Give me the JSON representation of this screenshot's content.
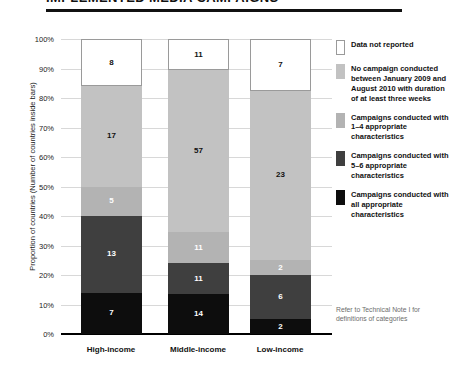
{
  "title": "IMPLEMENTED MEDIA CAMPAIGNS",
  "axis": {
    "y_title": "Proportion of countries (Number of countries inside bars)",
    "y_ticks": [
      "100%",
      "90%",
      "80%",
      "70%",
      "60%",
      "50%",
      "40%",
      "30%",
      "20%",
      "10%",
      "0%"
    ]
  },
  "legend": {
    "items": [
      {
        "label": "Data not reported",
        "color": "#ffffff",
        "border": "#9a9a9a"
      },
      {
        "label": "No campaign conducted between January 2009 and August 2010 with duration of at least three weeks",
        "color": "#c2c2c2",
        "border": "#c2c2c2"
      },
      {
        "label": "Campaigns conducted with 1–4 appropriate characteristics",
        "color": "#b3b3b3",
        "border": "#b3b3b3"
      },
      {
        "label": "Campaigns conducted with 5–6 appropriate characteristics",
        "color": "#3f3f3f",
        "border": "#3f3f3f"
      },
      {
        "label": "Campaigns conducted with all appropriate characteristics",
        "color": "#0d0d0d",
        "border": "#0d0d0d"
      }
    ]
  },
  "technical_note": "Refer to Technical Note I for definitions of categories",
  "chart_data": {
    "type": "bar",
    "subtype": "stacked-100-percent",
    "title": "IMPLEMENTED MEDIA CAMPAIGNS",
    "xlabel": "",
    "ylabel": "Proportion of countries (Number of countries inside bars)",
    "ylim": [
      0,
      100
    ],
    "ytick_step": 10,
    "grid": true,
    "legend_position": "right",
    "categories": [
      "High-income",
      "Middle-income",
      "Low-income"
    ],
    "category_totals": [
      50,
      104,
      40
    ],
    "stack_order_bottom_to_top": [
      "Campaigns conducted with all appropriate characteristics",
      "Campaigns conducted with 5–6 appropriate characteristics",
      "Campaigns conducted with 1–4 appropriate characteristics",
      "No campaign conducted between January 2009 and August 2010 with duration of at least three weeks",
      "Data not reported"
    ],
    "series": [
      {
        "name": "Campaigns conducted with all appropriate characteristics",
        "color": "#0d0d0d",
        "label_color": "#ffffff",
        "values": [
          7,
          14,
          2
        ],
        "percents": [
          14.0,
          13.5,
          5.0
        ]
      },
      {
        "name": "Campaigns conducted with 5–6 appropriate characteristics",
        "color": "#3f3f3f",
        "label_color": "#ffffff",
        "values": [
          13,
          11,
          6
        ],
        "percents": [
          26.0,
          10.6,
          15.0
        ]
      },
      {
        "name": "Campaigns conducted with 1–4 appropriate characteristics",
        "color": "#b3b3b3",
        "label_color": "#ffffff",
        "values": [
          5,
          11,
          2
        ],
        "percents": [
          10.0,
          10.6,
          5.0
        ]
      },
      {
        "name": "No campaign conducted between January 2009 and August 2010 with duration of at least three weeks",
        "color": "#c2c2c2",
        "label_color": "#111111",
        "values": [
          17,
          57,
          23
        ],
        "percents": [
          34.0,
          54.8,
          57.5
        ]
      },
      {
        "name": "Data not reported",
        "color": "#ffffff",
        "label_color": "#111111",
        "values": [
          8,
          11,
          7
        ],
        "percents": [
          16.0,
          10.6,
          17.5
        ]
      }
    ]
  }
}
